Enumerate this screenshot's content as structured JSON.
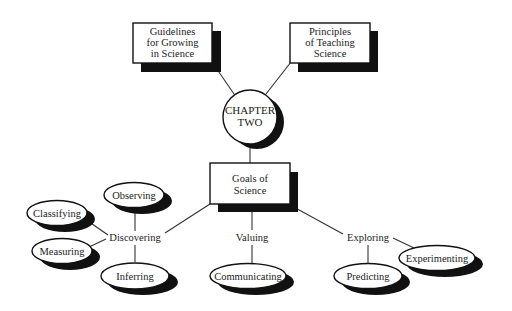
{
  "diagram": {
    "colors": {
      "background": "#ffffff",
      "outline": "#111111",
      "shadow": "#111111",
      "text": "#222222",
      "connector": "#333333"
    },
    "top_boxes": [
      {
        "lines": [
          "Guidelines",
          "for Growing",
          "in Science"
        ]
      },
      {
        "lines": [
          "Principles",
          "of Teaching",
          "Science"
        ]
      }
    ],
    "center": {
      "lines": [
        "CHAPTER",
        "TWO"
      ]
    },
    "goals_box": {
      "lines": [
        "Goals of",
        "Science"
      ]
    },
    "branches": [
      {
        "label": "Discovering",
        "children": [
          "Observing",
          "Classifying",
          "Measuring",
          "Inferring"
        ]
      },
      {
        "label": "Valuing",
        "children": [
          "Communicating"
        ]
      },
      {
        "label": "Exploring",
        "children": [
          "Predicting",
          "Experimenting"
        ]
      }
    ]
  }
}
